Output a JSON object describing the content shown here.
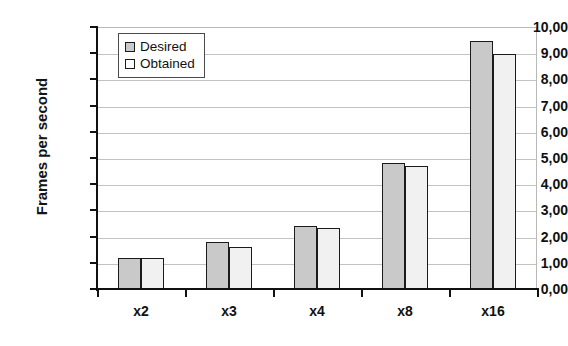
{
  "chart_data": {
    "type": "bar",
    "title": "",
    "xlabel": "",
    "ylabel": "Frames per second",
    "categories": [
      "x2",
      "x3",
      "x4",
      "x8",
      "x16"
    ],
    "series": [
      {
        "name": "Desired",
        "values": [
          1.2,
          1.8,
          2.4,
          4.8,
          9.45
        ]
      },
      {
        "name": "Obtained",
        "values": [
          1.2,
          1.62,
          2.33,
          4.7,
          8.97
        ]
      }
    ],
    "ylim": [
      0,
      10
    ],
    "ytick_values": [
      0,
      1,
      2,
      3,
      4,
      5,
      6,
      7,
      8,
      9,
      10
    ],
    "ytick_labels": [
      "0,00",
      "1,00",
      "2,00",
      "3,00",
      "4,00",
      "5,00",
      "6,00",
      "7,00",
      "8,00",
      "9,00",
      "10,00"
    ],
    "grid": true,
    "legend_position": "top-left",
    "colors": {
      "desired": "#c9c9c9",
      "obtained": "#f1f1f1",
      "bar_outline": "#1b1b1b",
      "axis": "#111111",
      "gridline": "#c2c2c2",
      "background": "#ffffff"
    }
  }
}
